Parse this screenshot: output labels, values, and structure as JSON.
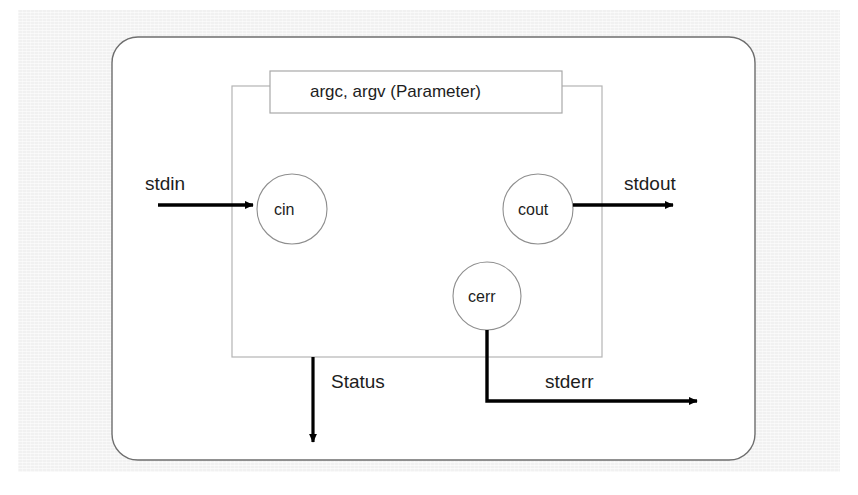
{
  "diagram": {
    "type": "flow-diagram",
    "background_color": "#f1f1f1",
    "canvas_color": "#ffffff",
    "line_color": "#9a9a9a",
    "arrow_color": "#000000",
    "text_color": "#1d1d1d",
    "parameter_box": {
      "label": "argc, argv (Parameter)"
    },
    "nodes": [
      {
        "id": "cin",
        "label": "cin",
        "shape": "circle",
        "cx": 292,
        "cy": 209,
        "r": 35
      },
      {
        "id": "cout",
        "label": "cout",
        "shape": "circle",
        "cx": 538,
        "cy": 209,
        "r": 35
      },
      {
        "id": "cerr",
        "label": "cerr",
        "shape": "circle",
        "cx": 487,
        "cy": 296,
        "r": 34
      }
    ],
    "flows": [
      {
        "id": "stdin",
        "label": "stdin",
        "direction": "in",
        "target": "cin"
      },
      {
        "id": "stdout",
        "label": "stdout",
        "direction": "out",
        "source": "cout"
      },
      {
        "id": "stderr",
        "label": "stderr",
        "direction": "out",
        "source": "cerr"
      },
      {
        "id": "status",
        "label": "Status",
        "direction": "out",
        "source": "program"
      }
    ]
  }
}
